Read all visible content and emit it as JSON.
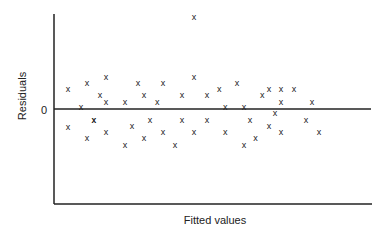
{
  "chart_data": {
    "type": "scatter",
    "title": "",
    "xlabel": "Fitted values",
    "ylabel": "Residuals",
    "y_tick_labels": [
      "0"
    ],
    "reference_line": {
      "y": 0,
      "label": "0"
    },
    "marker": "x",
    "grid": false,
    "legend": null,
    "xlim": [
      0,
      10
    ],
    "ylim": [
      -16,
      16
    ],
    "points": [
      {
        "x": 0.44,
        "y": 3.3
      },
      {
        "x": 0.44,
        "y": -3.0
      },
      {
        "x": 0.85,
        "y": 0.3
      },
      {
        "x": 1.04,
        "y": 4.3
      },
      {
        "x": 1.25,
        "y": -1.8
      },
      {
        "x": 1.04,
        "y": -4.8
      },
      {
        "x": 1.45,
        "y": 2.3
      },
      {
        "x": 1.26,
        "y": -1.8
      },
      {
        "x": 1.64,
        "y": 5.3
      },
      {
        "x": 1.64,
        "y": 1.2
      },
      {
        "x": 1.64,
        "y": -3.8
      },
      {
        "x": 2.24,
        "y": 1.2
      },
      {
        "x": 2.24,
        "y": -6.0
      },
      {
        "x": 2.46,
        "y": -2.8
      },
      {
        "x": 2.65,
        "y": 4.3
      },
      {
        "x": 2.84,
        "y": 2.3
      },
      {
        "x": 2.84,
        "y": -4.8
      },
      {
        "x": 3.26,
        "y": 1.2
      },
      {
        "x": 3.03,
        "y": -1.8
      },
      {
        "x": 3.44,
        "y": 4.3
      },
      {
        "x": 3.44,
        "y": -3.8
      },
      {
        "x": 4.04,
        "y": 2.3
      },
      {
        "x": 4.04,
        "y": -1.8
      },
      {
        "x": 3.82,
        "y": -6.0
      },
      {
        "x": 4.42,
        "y": 15.3
      },
      {
        "x": 4.42,
        "y": 5.3
      },
      {
        "x": 4.42,
        "y": -3.8
      },
      {
        "x": 4.83,
        "y": 2.3
      },
      {
        "x": 4.83,
        "y": -1.8
      },
      {
        "x": 5.21,
        "y": 3.3
      },
      {
        "x": 5.4,
        "y": 0.3
      },
      {
        "x": 5.4,
        "y": -3.8
      },
      {
        "x": 5.77,
        "y": 4.3
      },
      {
        "x": 5.99,
        "y": 0.3
      },
      {
        "x": 5.99,
        "y": -6.0
      },
      {
        "x": 6.18,
        "y": -1.8
      },
      {
        "x": 6.36,
        "y": -4.8
      },
      {
        "x": 6.57,
        "y": 2.3
      },
      {
        "x": 6.78,
        "y": -2.8
      },
      {
        "x": 6.78,
        "y": 3.3
      },
      {
        "x": 7.16,
        "y": 3.3
      },
      {
        "x": 6.97,
        "y": -0.7
      },
      {
        "x": 7.16,
        "y": 1.2
      },
      {
        "x": 7.16,
        "y": -3.8
      },
      {
        "x": 7.57,
        "y": 3.3
      },
      {
        "x": 8.14,
        "y": 1.2
      },
      {
        "x": 7.95,
        "y": -1.8
      },
      {
        "x": 8.36,
        "y": -3.8
      }
    ]
  }
}
